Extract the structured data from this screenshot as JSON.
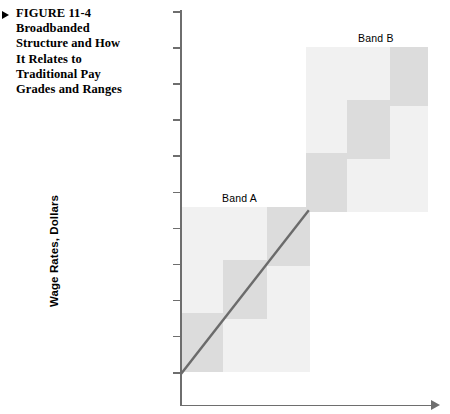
{
  "figure": {
    "marker_icon": "triangle-right-icon",
    "caption": "FIGURE 11-4 Broadbanded Structure and How It Relates to Traditional Pay Grades and Ranges",
    "caption_lines": [
      "FIGURE 11-4",
      "Broadbanded",
      "Structure and How",
      "It Relates to",
      "Traditional Pay",
      "Grades and Ranges"
    ]
  },
  "chart_data": {
    "type": "area",
    "xlabel": "",
    "ylabel": "Wage Rates, Dollars",
    "grid": false,
    "legend": "none",
    "axis": {
      "y_tick_count": 11,
      "y_tick_labels": [],
      "x_tick_labels": [],
      "x_arrow": true,
      "y_arrow": false,
      "axis_color": "#6e6e6e"
    },
    "colors": {
      "band_fill": "#f1f1f1",
      "grade_fill": "#dcdcdc",
      "trend_line": "#6b6b6b",
      "axis": "#6e6e6e",
      "text": "#000000"
    },
    "bands": [
      {
        "name": "Band A",
        "label": "Band A",
        "label_x": 222,
        "label_y": 192,
        "rect": {
          "x": 182,
          "y": 207,
          "w": 128,
          "h": 165
        },
        "grades": [
          {
            "name": "Grade 1",
            "x": 182,
            "y": 313,
            "w": 41,
            "h": 59
          },
          {
            "name": "Grade 2",
            "x": 223,
            "y": 260,
            "w": 44,
            "h": 59
          },
          {
            "name": "Grade 3",
            "x": 267,
            "y": 207,
            "w": 43,
            "h": 59
          }
        ]
      },
      {
        "name": "Band B",
        "label": "Band B",
        "label_x": 358,
        "label_y": 32,
        "rect": {
          "x": 306,
          "y": 47,
          "w": 122,
          "h": 165
        },
        "grades": [
          {
            "name": "Grade 4",
            "x": 306,
            "y": 153,
            "w": 41,
            "h": 59
          },
          {
            "name": "Grade 5",
            "x": 347,
            "y": 100,
            "w": 43,
            "h": 59
          },
          {
            "name": "Grade 6",
            "x": 390,
            "y": 47,
            "w": 38,
            "h": 59
          }
        ]
      }
    ],
    "trend_line": {
      "name": "traditional-pay-line",
      "x1": 182,
      "y1": 372,
      "x2": 310,
      "y2": 208,
      "width": 2.4
    }
  }
}
